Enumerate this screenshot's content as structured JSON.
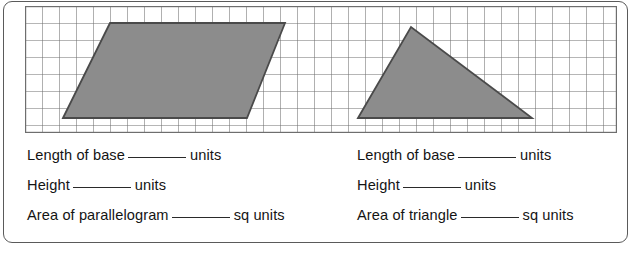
{
  "worksheet": {
    "grid": {
      "columns": 35,
      "rows": 7,
      "cell_size": 17,
      "line_color": "#6e6e6e",
      "background": "#ffffff"
    },
    "shapes": [
      {
        "name": "parallelogram",
        "fill_color": "#8c8c8c",
        "stroke_color": "#4a4a4a",
        "points": "38,112 85,17 260,17 222,112",
        "base_units": 9,
        "height_units": 5
      },
      {
        "name": "triangle",
        "fill_color": "#8c8c8c",
        "stroke_color": "#4a4a4a",
        "points": "333,112 386,21 507,112",
        "base_units": 10,
        "height_units": 5
      }
    ],
    "columns": [
      {
        "id": "parallelogram",
        "lines": [
          {
            "label": "Length of base",
            "unit": "units"
          },
          {
            "label": "Height",
            "unit": "units"
          },
          {
            "label": "Area of parallelogram",
            "unit": "sq units"
          }
        ]
      },
      {
        "id": "triangle",
        "lines": [
          {
            "label": "Length of base",
            "unit": "units"
          },
          {
            "label": "Height",
            "unit": "units"
          },
          {
            "label": "Area of triangle",
            "unit": "sq units"
          }
        ]
      }
    ]
  }
}
